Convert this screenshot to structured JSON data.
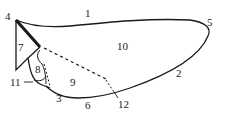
{
  "diagram": {
    "type": "labeled outline diagram (wing/shell-like shape)",
    "colors": {
      "line": "#1a1a1a",
      "background": "#ffffff",
      "text": "#222222"
    },
    "labels": [
      {
        "id": "1",
        "text": "1",
        "x": 85,
        "y": 14
      },
      {
        "id": "2",
        "text": "2",
        "x": 176,
        "y": 74
      },
      {
        "id": "3",
        "text": "3",
        "x": 56,
        "y": 99
      },
      {
        "id": "4",
        "text": "4",
        "x": 5,
        "y": 13
      },
      {
        "id": "5",
        "text": "5",
        "x": 207,
        "y": 17
      },
      {
        "id": "6",
        "text": "6",
        "x": 85,
        "y": 104
      },
      {
        "id": "7",
        "text": "7",
        "x": 17,
        "y": 41
      },
      {
        "id": "8",
        "text": "8",
        "x": 35,
        "y": 67
      },
      {
        "id": "9",
        "text": "9",
        "x": 70,
        "y": 79
      },
      {
        "id": "10",
        "text": "10",
        "x": 117,
        "y": 42
      },
      {
        "id": "11",
        "text": "11",
        "x": 10,
        "y": 79
      },
      {
        "id": "12",
        "text": "12",
        "x": 118,
        "y": 101
      }
    ]
  }
}
